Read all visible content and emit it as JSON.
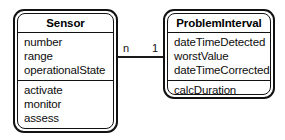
{
  "diagram": {
    "type": "uml-class-diagram",
    "title": "",
    "background_color": "#ffffff",
    "line_color": "#121212",
    "text_color": "#0d0d0d"
  },
  "classes": [
    {
      "id": "sensor",
      "name": "Sensor",
      "attributes": [
        "number",
        "range",
        "operationalState"
      ],
      "operations": [
        "activate",
        "monitor",
        "assess"
      ]
    },
    {
      "id": "problem_interval",
      "name": "ProblemInterval",
      "attributes": [
        "dateTimeDetected",
        "worstValue",
        "dateTimeCorrected"
      ],
      "operations": [
        "calcDuration"
      ]
    }
  ],
  "association": {
    "source_class": "Sensor",
    "target_class": "ProblemInterval",
    "source_multiplicity": "n",
    "target_multiplicity": "1",
    "label": ""
  }
}
